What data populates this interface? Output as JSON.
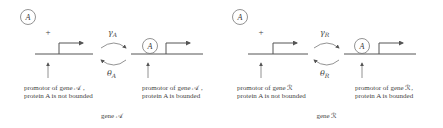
{
  "panels": [
    {
      "id": "A",
      "protein_label": "A",
      "plus_label": "+",
      "rate_forward": {
        "symbol": "γ",
        "subscript": "A"
      },
      "rate_backward": {
        "symbol": "θ",
        "subscript": "A"
      },
      "bound_protein_label": "A",
      "caption_unbound_line1": "promotor of gene 𝒜 ,",
      "caption_unbound_line2": "protein A is not bounded",
      "caption_bound_line1": "promotor of gene 𝒜 ,",
      "caption_bound_line2": "protein A is bounded",
      "gene_label": "gene 𝒜"
    },
    {
      "id": "R",
      "protein_label": "A",
      "plus_label": "+",
      "rate_forward": {
        "symbol": "γ",
        "subscript": "R"
      },
      "rate_backward": {
        "symbol": "θ",
        "subscript": "R"
      },
      "bound_protein_label": "A",
      "caption_unbound_line1": "promotor of gene ℛ",
      "caption_unbound_line2": "protein A is not bounded",
      "caption_bound_line1": "promotor of gene ℛ,",
      "caption_bound_line2": "protein A is bounded",
      "gene_label": "gene ℛ"
    }
  ],
  "colors": {
    "stroke": "#555555",
    "text": "#444444"
  }
}
